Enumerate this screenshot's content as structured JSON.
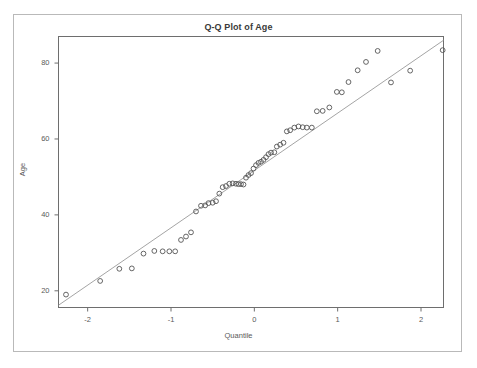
{
  "figure": {
    "title": "Q-Q Plot of Age",
    "xlabel": "Quantile",
    "ylabel": "Age",
    "frame_color": "#6e6e6e",
    "outer_border_color": "#b9b9b9",
    "point_color": "#555555",
    "line_color": "#9a9a9a",
    "background": "#ffffff"
  },
  "chart_data": {
    "type": "scatter",
    "title": "Q-Q Plot of Age",
    "xlabel": "Quantile",
    "ylabel": "Age",
    "xlim": [
      -2.35,
      2.27
    ],
    "ylim": [
      15.6,
      87.0
    ],
    "xticks": [
      -2,
      -1,
      0,
      1,
      2
    ],
    "xtick_labels": [
      "-2",
      "-1",
      "0",
      "1",
      "2"
    ],
    "yticks": [
      20,
      40,
      60,
      80
    ],
    "ytick_labels": [
      "20",
      "40",
      "60",
      "80"
    ],
    "grid": false,
    "legend": null,
    "series": [
      {
        "name": "Sample quantiles",
        "marker": "open-circle",
        "x": [
          -2.26,
          -1.85,
          -1.62,
          -1.47,
          -1.33,
          -1.2,
          -1.1,
          -1.02,
          -0.95,
          -0.88,
          -0.82,
          -0.76,
          -0.7,
          -0.64,
          -0.59,
          -0.55,
          -0.5,
          -0.46,
          -0.42,
          -0.38,
          -0.34,
          -0.3,
          -0.26,
          -0.22,
          -0.19,
          -0.16,
          -0.13,
          -0.1,
          -0.07,
          -0.04,
          -0.01,
          0.02,
          0.05,
          0.08,
          0.11,
          0.14,
          0.17,
          0.2,
          0.24,
          0.27,
          0.31,
          0.35,
          0.39,
          0.43,
          0.48,
          0.53,
          0.58,
          0.63,
          0.69,
          0.75,
          0.82,
          0.9,
          0.99,
          1.05,
          1.13,
          1.24,
          1.34,
          1.48,
          1.64,
          1.87,
          2.26
        ],
        "y": [
          19.0,
          22.6,
          25.8,
          25.9,
          29.8,
          30.5,
          30.4,
          30.4,
          30.4,
          33.4,
          34.3,
          35.4,
          40.9,
          42.4,
          42.5,
          43.1,
          43.2,
          43.6,
          45.6,
          47.3,
          47.6,
          48.2,
          48.3,
          48.2,
          48.1,
          48.1,
          48.0,
          49.8,
          50.5,
          51.0,
          52.2,
          53.1,
          53.7,
          54.0,
          54.5,
          55.2,
          56.0,
          56.4,
          56.5,
          58.0,
          58.5,
          59.0,
          62.0,
          62.3,
          63.0,
          63.3,
          63.1,
          63.0,
          63.0,
          67.3,
          67.4,
          68.3,
          72.4,
          72.3,
          75.0,
          78.1,
          80.3,
          83.2,
          74.9,
          78.0,
          83.4
        ]
      }
    ],
    "reference_line": {
      "name": "theoretical-quantile-line",
      "x": [
        -2.35,
        2.27
      ],
      "y": [
        16.2,
        86.0
      ]
    }
  }
}
